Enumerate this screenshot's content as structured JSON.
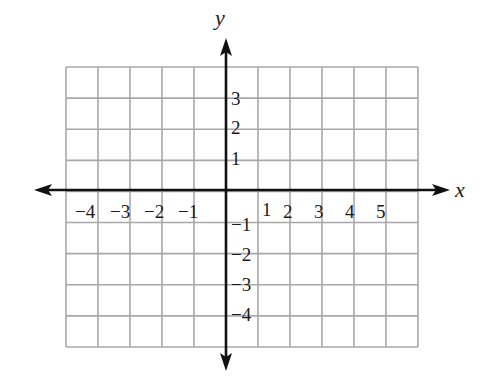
{
  "chart_data": {
    "type": "scatter",
    "title": "",
    "xlabel": "x",
    "ylabel": "y",
    "xlim": [
      -7,
      6
    ],
    "ylim": [
      -5,
      4
    ],
    "grid": true,
    "x_ticks": [
      -4,
      -3,
      -2,
      -1,
      1,
      2,
      3,
      4,
      5
    ],
    "x_tick_labels": [
      "−4",
      "−3",
      "−2",
      "−1",
      "1",
      "2",
      "3",
      "4",
      "5"
    ],
    "y_ticks": [
      3,
      2,
      1,
      -1,
      -2,
      -3,
      -4
    ],
    "y_tick_labels": [
      "3",
      "2",
      "1",
      "−1",
      "−2",
      "−3",
      "−4"
    ],
    "grid_columns": 11,
    "grid_rows": 9,
    "grid_x_range": [
      -7,
      4
    ],
    "grid_y_range": [
      -5,
      4
    ],
    "points": [],
    "series": []
  },
  "colors": {
    "grid": "#a8a8a8",
    "axis": "#111111",
    "text": "#1a1a1a",
    "background": "#ffffff"
  }
}
